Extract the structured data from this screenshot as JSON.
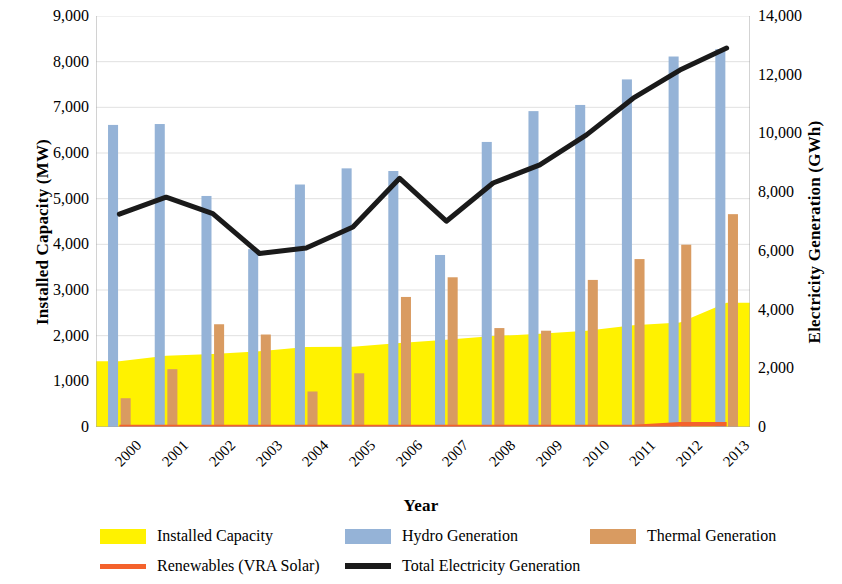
{
  "chart_data": {
    "type": "bar",
    "title": "",
    "xlabel": "Year",
    "ylabel": "Installed Capacity (MW)",
    "ylabel_secondary": "Electricity Generation (GWh)",
    "categories": [
      "2000",
      "2001",
      "2002",
      "2003",
      "2004",
      "2005",
      "2006",
      "2007",
      "2008",
      "2009",
      "2010",
      "2011",
      "2012",
      "2013"
    ],
    "ylim": [
      0,
      9000
    ],
    "ylim_secondary": [
      0,
      14000
    ],
    "yticks": [
      "0",
      "1,000",
      "2,000",
      "3,000",
      "4,000",
      "5,000",
      "6,000",
      "7,000",
      "8,000",
      "9,000"
    ],
    "yticks_secondary": [
      "0",
      "2,000",
      "4,000",
      "6,000",
      "8,000",
      "10,000",
      "12,000",
      "14,000"
    ],
    "grid": true,
    "legend_position": "bottom",
    "series": [
      {
        "name": "Installed Capacity",
        "type": "area",
        "axis": "left",
        "unit": "MW",
        "color": "#FFF200",
        "values": [
          1440,
          1560,
          1600,
          1660,
          1750,
          1760,
          1840,
          1910,
          1990,
          2040,
          2110,
          2230,
          2290,
          2720
        ]
      },
      {
        "name": "Hydro Generation",
        "type": "bar",
        "axis": "right",
        "unit": "GWh",
        "color": "#95B3D7",
        "values": [
          10290,
          10320,
          7870,
          6060,
          8260,
          8810,
          8720,
          5860,
          9710,
          10760,
          10970,
          11840,
          12620,
          12870
        ]
      },
      {
        "name": "Thermal Generation",
        "type": "bar",
        "axis": "right",
        "unit": "GWh",
        "color": "#D99B61",
        "values": [
          980,
          1970,
          3500,
          3150,
          1210,
          1830,
          4430,
          5100,
          3370,
          3280,
          5010,
          5720,
          6210,
          7250
        ]
      },
      {
        "name": "Renewables (VRA Solar)",
        "type": "line",
        "axis": "right",
        "unit": "GWh",
        "color": "#F4622C",
        "values": [
          0,
          0,
          0,
          0,
          0,
          0,
          0,
          0,
          0,
          0,
          0,
          0,
          90,
          90
        ]
      },
      {
        "name": "Total Electricity Generation",
        "type": "line",
        "axis": "right",
        "unit": "GWh",
        "color": "#1A1A1A",
        "values": [
          7250,
          7830,
          7270,
          5910,
          6100,
          6810,
          8470,
          7010,
          8310,
          8930,
          9950,
          11200,
          12160,
          12910
        ]
      }
    ]
  },
  "legend": {
    "items": [
      {
        "label": "Installed Capacity",
        "marker": "swatch",
        "color": "#FFF200"
      },
      {
        "label": "Hydro Generation",
        "marker": "swatch",
        "color": "#95B3D7"
      },
      {
        "label": "Thermal Generation",
        "marker": "swatch",
        "color": "#D99B61"
      },
      {
        "label": "Renewables (VRA Solar)",
        "marker": "line",
        "color": "#F4622C"
      },
      {
        "label": "Total Electricity Generation",
        "marker": "line",
        "color": "#1A1A1A"
      }
    ]
  },
  "axes": {
    "left": {
      "title": "Installed Capacity (MW)"
    },
    "right": {
      "title": "Electricity Generation (GWh)"
    },
    "bottom": {
      "title": "Year"
    }
  }
}
